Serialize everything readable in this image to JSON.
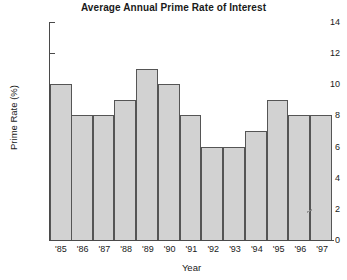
{
  "chart_data": {
    "type": "bar",
    "title": "Average Annual Prime Rate of Interest",
    "xlabel": "Year",
    "ylabel": "Prime Rate (%)",
    "categories": [
      "'85",
      "'86",
      "'87",
      "'88",
      "'89",
      "'90",
      "'91",
      "'92",
      "'93",
      "'94",
      "'95",
      "'96",
      "'97"
    ],
    "values": [
      10,
      8,
      8,
      9,
      11,
      10,
      8,
      6,
      6,
      7,
      9,
      8,
      8
    ],
    "ylim": [
      0,
      14
    ],
    "ytick_values": [
      0,
      2,
      4,
      6,
      8,
      10,
      12,
      14
    ],
    "ytick_labels": [
      "0",
      "2",
      "4",
      "6",
      "8",
      "10",
      "12",
      "14"
    ],
    "grid": false,
    "legend": null,
    "bar_fill_color": "#d2d2d2",
    "bar_border_color": "#555555",
    "axis_color": "#4a4a4a",
    "background_color": "#ffffff"
  }
}
